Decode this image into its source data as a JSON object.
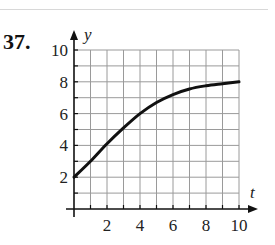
{
  "problem_number": "37.",
  "chart_data": {
    "type": "line",
    "title": "",
    "xlabel": "t",
    "ylabel": "y",
    "xlim": [
      0,
      10
    ],
    "ylim": [
      0,
      10
    ],
    "grid": true,
    "grid_step": 1,
    "x_ticks": [
      2,
      4,
      6,
      8,
      10
    ],
    "y_ticks": [
      2,
      4,
      6,
      8,
      10
    ],
    "series": [
      {
        "name": "y(t)",
        "x": [
          0,
          1,
          2,
          3,
          4,
          5,
          6,
          7,
          8,
          9,
          10
        ],
        "values": [
          2,
          3,
          4.1,
          5.1,
          6,
          6.7,
          7.2,
          7.55,
          7.75,
          7.88,
          8
        ]
      }
    ]
  }
}
